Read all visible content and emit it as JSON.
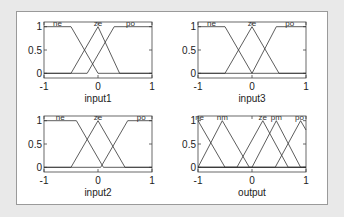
{
  "figure": {
    "background": "#e9e9e9",
    "frame_color": "#9a9a9a",
    "line_color": "#333333"
  },
  "chart_data": [
    {
      "type": "line",
      "title": "",
      "xlabel": "input1",
      "ylabel": "",
      "xlim": [
        -1,
        1
      ],
      "ylim": [
        -0.1,
        1.1
      ],
      "xticks": [
        "-1",
        "0",
        "1"
      ],
      "yticks": [
        "0",
        "0.5",
        "1"
      ],
      "grid": false,
      "series": [
        {
          "name": "ne",
          "points": [
            [
              -1,
              1
            ],
            [
              -0.5,
              1
            ],
            [
              0,
              0
            ],
            [
              1,
              0
            ]
          ]
        },
        {
          "name": "ze",
          "points": [
            [
              -1,
              0
            ],
            [
              -0.5,
              0
            ],
            [
              0,
              1
            ],
            [
              0.4,
              0
            ],
            [
              1,
              0
            ]
          ]
        },
        {
          "name": "po",
          "points": [
            [
              -1,
              0
            ],
            [
              -0.2,
              0
            ],
            [
              0.3,
              1
            ],
            [
              1,
              1
            ]
          ]
        }
      ],
      "labels": [
        {
          "text": "ne",
          "x": -0.75
        },
        {
          "text": "ze",
          "x": 0
        },
        {
          "text": "po",
          "x": 0.6
        }
      ]
    },
    {
      "type": "line",
      "title": "",
      "xlabel": "input3",
      "ylabel": "",
      "xlim": [
        -1,
        1
      ],
      "ylim": [
        -0.1,
        1.1
      ],
      "xticks": [
        "-1",
        "0",
        "1"
      ],
      "yticks": [
        "0",
        "0.5",
        "1"
      ],
      "grid": false,
      "series": [
        {
          "name": "ne",
          "points": [
            [
              -1,
              1
            ],
            [
              -0.5,
              1
            ],
            [
              0,
              0
            ],
            [
              1,
              0
            ]
          ]
        },
        {
          "name": "ze",
          "points": [
            [
              -1,
              0
            ],
            [
              -0.5,
              0
            ],
            [
              0,
              1
            ],
            [
              0.5,
              0
            ],
            [
              1,
              0
            ]
          ]
        },
        {
          "name": "po",
          "points": [
            [
              -1,
              0
            ],
            [
              0,
              0
            ],
            [
              0.45,
              1
            ],
            [
              1,
              1
            ]
          ]
        }
      ],
      "labels": [
        {
          "text": "ne",
          "x": -0.75
        },
        {
          "text": "ze",
          "x": 0
        },
        {
          "text": "po",
          "x": 0.7
        }
      ]
    },
    {
      "type": "line",
      "title": "",
      "xlabel": "input2",
      "ylabel": "",
      "xlim": [
        -1,
        1
      ],
      "ylim": [
        -0.1,
        1.1
      ],
      "xticks": [
        "-1",
        "0",
        "1"
      ],
      "yticks": [
        "0",
        "0.5",
        "1"
      ],
      "grid": false,
      "series": [
        {
          "name": "ne",
          "points": [
            [
              -1,
              1
            ],
            [
              -0.4,
              1
            ],
            [
              0.1,
              0
            ],
            [
              1,
              0
            ]
          ]
        },
        {
          "name": "ze",
          "points": [
            [
              -1,
              0
            ],
            [
              -0.5,
              0
            ],
            [
              0,
              1
            ],
            [
              0.5,
              0
            ],
            [
              1,
              0
            ]
          ]
        },
        {
          "name": "po",
          "points": [
            [
              -1,
              0
            ],
            [
              0.05,
              0
            ],
            [
              0.55,
              1
            ],
            [
              1,
              1
            ]
          ]
        }
      ],
      "labels": [
        {
          "text": "ne",
          "x": -0.7
        },
        {
          "text": "ze",
          "x": 0
        },
        {
          "text": "po",
          "x": 0.8
        }
      ]
    },
    {
      "type": "line",
      "title": "",
      "xlabel": "output",
      "ylabel": "",
      "xlim": [
        -1,
        1
      ],
      "ylim": [
        -0.1,
        1.1
      ],
      "xticks": [
        "-1",
        "0",
        "1"
      ],
      "yticks": [
        "0",
        "0.5",
        "1"
      ],
      "grid": false,
      "series": [
        {
          "name": "ne",
          "points": [
            [
              -1,
              1
            ],
            [
              -0.5,
              0
            ],
            [
              1,
              0
            ]
          ]
        },
        {
          "name": "nm",
          "points": [
            [
              -1,
              0
            ],
            [
              -0.55,
              1
            ],
            [
              -0.05,
              0
            ],
            [
              1,
              0
            ]
          ]
        },
        {
          "name": "ze",
          "points": [
            [
              -1,
              0
            ],
            [
              -0.28,
              0
            ],
            [
              0.2,
              1
            ],
            [
              0.67,
              0
            ],
            [
              1,
              0
            ]
          ]
        },
        {
          "name": "pm",
          "points": [
            [
              -1,
              0
            ],
            [
              0,
              0
            ],
            [
              0.45,
              1
            ],
            [
              0.9,
              0
            ],
            [
              1,
              0
            ]
          ]
        },
        {
          "name": "po",
          "points": [
            [
              -1,
              0
            ],
            [
              0.43,
              0
            ],
            [
              0.9,
              1
            ],
            [
              1,
              0.8
            ]
          ]
        }
      ],
      "labels": [
        {
          "text": "ne",
          "x": -0.97
        },
        {
          "text": "nm",
          "x": -0.55
        },
        {
          "text": "ze",
          "x": 0.2
        },
        {
          "text": "pm",
          "x": 0.45
        },
        {
          "text": "po",
          "x": 0.88
        }
      ]
    }
  ]
}
